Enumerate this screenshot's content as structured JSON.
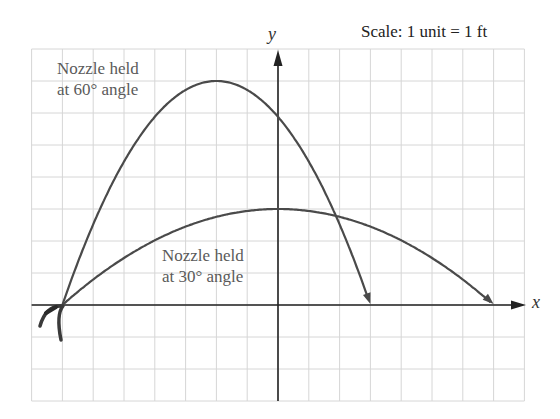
{
  "chart_data": {
    "type": "line",
    "title": "",
    "scale_note": "Scale: 1 unit = 1 ft",
    "xlabel": "x",
    "ylabel": "y",
    "xlim": [
      -8,
      8
    ],
    "ylim": [
      -3,
      8
    ],
    "grid": true,
    "tick_labels_shown": false,
    "series": [
      {
        "name": "Nozzle held at 60° angle",
        "label_lines": [
          "Nozzle held",
          "at 60° angle"
        ],
        "x": [
          -7,
          -6,
          -5,
          -4,
          -3,
          -2,
          -1,
          0,
          1,
          2,
          3
        ],
        "y": [
          0,
          2.52,
          4.48,
          5.88,
          6.72,
          7,
          6.72,
          5.88,
          4.48,
          2.52,
          0
        ],
        "vertex": [
          -2,
          7
        ],
        "roots": [
          -7,
          3
        ],
        "arrow_end": true
      },
      {
        "name": "Nozzle held at 30° angle",
        "label_lines": [
          "Nozzle held",
          "at 30° angle"
        ],
        "x": [
          -7,
          -6,
          -5,
          -4,
          -3,
          -2,
          -1,
          0,
          1,
          2,
          3,
          4,
          5,
          6,
          7
        ],
        "y": [
          0,
          0.8,
          1.47,
          2.02,
          2.45,
          2.76,
          2.94,
          3,
          2.94,
          2.76,
          2.45,
          2.02,
          1.47,
          0.8,
          0
        ],
        "vertex": [
          0,
          3
        ],
        "roots": [
          -7,
          7
        ],
        "arrow_end": true
      }
    ],
    "annotations": [
      "Nozzle held at 60° angle",
      "Nozzle held at 30° angle",
      "Scale: 1 unit = 1 ft"
    ]
  },
  "labels": {
    "scale": "Scale: 1 unit = 1 ft",
    "x_axis": "x",
    "y_axis": "y",
    "series60_line1": "Nozzle held",
    "series60_line2": "at 60° angle",
    "series30_line1": "Nozzle held",
    "series30_line2": "at 30° angle"
  },
  "colors": {
    "curve": "#4a4a4a",
    "axis": "#222222",
    "grid": "#d6d6d6",
    "label": "#5a5a5a"
  }
}
